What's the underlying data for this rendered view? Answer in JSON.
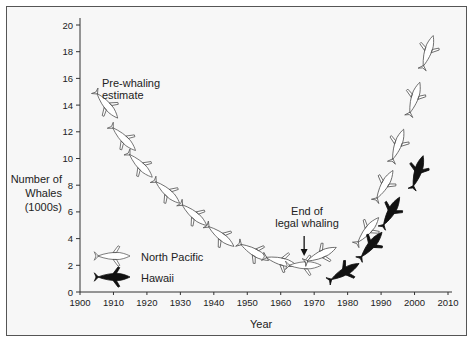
{
  "chart_data": {
    "type": "scatter",
    "title": "",
    "xlabel": "Year",
    "ylabel": "Number of Whales (1000s)",
    "ylabel_lines": [
      "Number of",
      "Whales",
      "(1000s)"
    ],
    "xlim": [
      1900,
      2010
    ],
    "ylim": [
      0,
      20
    ],
    "x_ticks": [
      1900,
      1910,
      1920,
      1930,
      1940,
      1950,
      1960,
      1970,
      1980,
      1990,
      2000,
      2010
    ],
    "y_ticks": [
      0,
      2,
      4,
      6,
      8,
      10,
      12,
      14,
      16,
      18,
      20
    ],
    "grid": false,
    "legend_position": "lower-left",
    "series": [
      {
        "name": "North Pacific",
        "marker": "whale-outline",
        "points": [
          {
            "x": 1908,
            "y": 14.0
          },
          {
            "x": 1913,
            "y": 11.5
          },
          {
            "x": 1918,
            "y": 9.5
          },
          {
            "x": 1926,
            "y": 7.5
          },
          {
            "x": 1934,
            "y": 5.8
          },
          {
            "x": 1942,
            "y": 4.2
          },
          {
            "x": 1952,
            "y": 3.0
          },
          {
            "x": 1960,
            "y": 2.3
          },
          {
            "x": 1967,
            "y": 2.0
          },
          {
            "x": 1972,
            "y": 2.8
          },
          {
            "x": 1986,
            "y": 4.6
          },
          {
            "x": 1991,
            "y": 8.0
          },
          {
            "x": 1995,
            "y": 11.0
          },
          {
            "x": 2000,
            "y": 14.5
          },
          {
            "x": 2004,
            "y": 18.0
          }
        ]
      },
      {
        "name": "Hawaii",
        "marker": "whale-filled",
        "points": [
          {
            "x": 1979,
            "y": 1.5
          },
          {
            "x": 1987,
            "y": 3.5
          },
          {
            "x": 1993,
            "y": 6.0
          },
          {
            "x": 2001,
            "y": 9.0
          }
        ]
      }
    ],
    "annotations": [
      {
        "text": "Pre-whaling estimate",
        "x": 1908,
        "y": 15.2
      },
      {
        "text": "End of legal whaling",
        "x": 1967,
        "y": 3.4,
        "arrow": true
      }
    ]
  },
  "labels": {
    "ylabel_1": "Number of",
    "ylabel_2": "Whales",
    "ylabel_3": "(1000s)",
    "xlabel": "Year",
    "annot_pre_1": "Pre-whaling",
    "annot_pre_2": "estimate",
    "annot_end_1": "End of",
    "annot_end_2": "legal whaling",
    "legend_np": "North Pacific",
    "legend_hawaii": "Hawaii"
  }
}
